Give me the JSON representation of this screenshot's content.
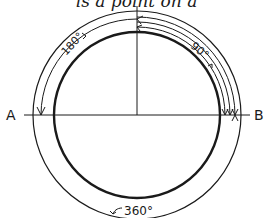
{
  "caption": "is a point on a",
  "diagram": {
    "points": [
      {
        "id": "A",
        "label": "A"
      },
      {
        "id": "B",
        "label": "B"
      }
    ],
    "angles": [
      {
        "id": "90",
        "label": "90°",
        "from": "top",
        "to": "B"
      },
      {
        "id": "180",
        "label": "180°",
        "from": "top",
        "to": "A"
      },
      {
        "id": "360",
        "label": "360°",
        "from": "full",
        "to": "full"
      }
    ],
    "colors": {
      "ink": "#1a1a1a",
      "background": "#ffffff"
    }
  }
}
